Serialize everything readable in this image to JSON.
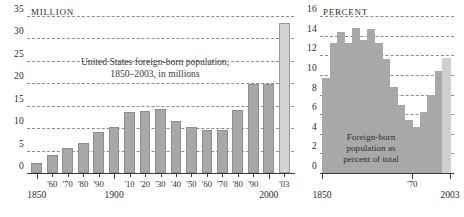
{
  "chart_data": [
    {
      "id": "foreign_born_millions",
      "type": "bar",
      "title": "United States foreign-born population, 1850–2003, in millions",
      "title_line1": "United States foreign-born population,",
      "title_line2": "1850–2003, in millions",
      "unit_label": "MILLION",
      "xlabel": "",
      "ylabel": "MILLION",
      "ylim": [
        0,
        35
      ],
      "yticks": [
        0,
        5,
        10,
        15,
        20,
        25,
        30,
        35
      ],
      "ytick_labels": [
        "0",
        "5",
        "10",
        "15",
        "20",
        "25",
        "30",
        "35"
      ],
      "grid": true,
      "legend": "none",
      "categories": [
        "1850",
        "'60",
        "'70",
        "'80",
        "'90",
        "1900",
        "'10",
        "'20",
        "'30",
        "'40",
        "'50",
        "'60",
        "'70",
        "'80",
        "'90",
        "2000",
        "'03"
      ],
      "major_tick_labels": [
        "1850",
        "1900",
        "2000"
      ],
      "values": [
        2.2,
        4.1,
        5.6,
        6.7,
        9.2,
        10.3,
        13.5,
        13.9,
        14.2,
        11.6,
        10.3,
        9.7,
        9.6,
        14.1,
        19.8,
        19.8,
        33.5
      ],
      "highlight_last": true,
      "bar_color": "#a8a8a8",
      "highlight_color": "#d2d2d2"
    },
    {
      "id": "foreign_born_percent",
      "type": "bar",
      "title": "Foreign-born population as percent of total",
      "caption_lines": [
        "Foreign-born",
        "population as",
        "percent of total"
      ],
      "unit_label": "PERCENT",
      "xlabel": "",
      "ylabel": "PERCENT",
      "ylim": [
        0,
        16
      ],
      "yticks": [
        0,
        2,
        4,
        6,
        8,
        10,
        12,
        14,
        16
      ],
      "ytick_labels": [
        "0",
        "2",
        "4",
        "6",
        "8",
        "10",
        "12",
        "14",
        "16"
      ],
      "grid": true,
      "legend": "none",
      "x": [
        "1850",
        "1860",
        "1870",
        "1880",
        "1890",
        "1900",
        "1910",
        "1920",
        "1930",
        "1940",
        "1950",
        "1960",
        "1970",
        "1980",
        "1990",
        "2000",
        "2003"
      ],
      "major_tick_labels": [
        "1850",
        "'70",
        "2003"
      ],
      "values": [
        9.7,
        13.2,
        14.4,
        13.3,
        14.8,
        13.6,
        14.7,
        13.2,
        11.6,
        8.8,
        6.9,
        5.4,
        4.7,
        6.2,
        7.9,
        10.4,
        11.7
      ],
      "highlight_last": true,
      "bar_color": "#a8a8a8",
      "highlight_color": "#cfcfcf"
    }
  ],
  "left_chart": {
    "unit_label": "MILLION",
    "y_labels": [
      "35",
      "30",
      "25",
      "20",
      "15",
      "10",
      "5",
      "0"
    ],
    "title_line1": "United States foreign-born population,",
    "title_line2": "1850–2003, in millions",
    "x_labels": [
      "1850",
      "'60",
      "'70",
      "'80",
      "'90",
      "1900",
      "'10",
      "'20",
      "'30",
      "'40",
      "'50",
      "'60",
      "'70",
      "'80",
      "'90",
      "2000",
      "'03"
    ]
  },
  "right_chart": {
    "unit_label": "PERCENT",
    "y_labels": [
      "16",
      "14",
      "12",
      "10",
      "8",
      "6",
      "4",
      "2",
      "0"
    ],
    "caption_line1": "Foreign-born",
    "caption_line2": "population as",
    "caption_line3": "percent of total",
    "x_labels": [
      "1850",
      "'70",
      "2003"
    ]
  }
}
